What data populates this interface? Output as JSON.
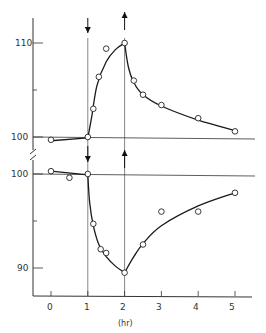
{
  "chart_data": [
    {
      "type": "line",
      "panel": "upper",
      "title": "",
      "xlabel": "(hr)",
      "ylabel": "",
      "ylim": [
        99,
        113
      ],
      "y_ticks": [
        100,
        110
      ],
      "y_tick_labels": [
        "100",
        "110"
      ],
      "markers": [
        {
          "x": 1,
          "direction": "down"
        },
        {
          "x": 2,
          "direction": "up"
        }
      ],
      "points": {
        "x": [
          0,
          1,
          1.15,
          1.3,
          1.5,
          2,
          2.25,
          2.5,
          3,
          4,
          5
        ],
        "y": [
          99.7,
          100,
          103,
          106.4,
          109.4,
          110,
          106,
          104.5,
          103.4,
          102,
          100.6
        ]
      },
      "curve": {
        "x": [
          0,
          1,
          1.1,
          1.25,
          1.5,
          1.75,
          2,
          2.1,
          2.25,
          2.5,
          3,
          4,
          5
        ],
        "y": [
          99.6,
          99.9,
          102,
          105.5,
          108,
          109.3,
          110,
          107.5,
          105.8,
          104.5,
          103.3,
          101.8,
          100.7
        ]
      }
    },
    {
      "type": "line",
      "panel": "lower",
      "title": "",
      "xlabel": "(hr)",
      "ylabel": "",
      "ylim": [
        87,
        101
      ],
      "y_ticks": [
        90,
        95,
        100
      ],
      "y_tick_labels": [
        "90",
        "",
        "100"
      ],
      "markers": [
        {
          "x": 1,
          "direction": "down"
        },
        {
          "x": 2,
          "direction": "up"
        }
      ],
      "points": {
        "x": [
          0,
          0.5,
          1,
          1.15,
          1.35,
          1.5,
          2,
          2.5,
          3,
          4,
          5
        ],
        "y": [
          100.3,
          99.6,
          100,
          94.7,
          92,
          91.6,
          89.5,
          92.5,
          96,
          96,
          98
        ]
      },
      "curve": {
        "x": [
          0,
          1,
          1.05,
          1.15,
          1.3,
          1.5,
          1.75,
          2,
          2.25,
          2.5,
          3,
          4,
          5
        ],
        "y": [
          100.3,
          99.9,
          97,
          94.5,
          92.5,
          91.2,
          90.2,
          89.5,
          91.2,
          92.6,
          94.5,
          96.6,
          98
        ]
      }
    }
  ],
  "axis": {
    "x_ticks": [
      0,
      1,
      2,
      3,
      4,
      5
    ],
    "x_tick_labels": [
      "0",
      "1",
      "2",
      "3",
      "4",
      "5"
    ],
    "x_label": "(hr)",
    "upper_y_labels": [
      "110",
      "100"
    ],
    "lower_y_labels": [
      "100",
      "90"
    ]
  },
  "colors": {
    "line": "#1a1a1a",
    "marker_fill": "#ffffff",
    "axis": "#333333"
  }
}
